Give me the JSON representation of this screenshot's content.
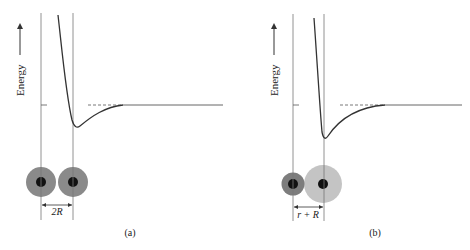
{
  "figure": {
    "y_axis_label": "Energy",
    "panels": [
      {
        "id": "a",
        "caption": "(a)",
        "distance_label": "2R",
        "atoms": [
          {
            "label": "atom-1",
            "radius_size": "R",
            "shade": "#8a8a8a"
          },
          {
            "label": "atom-2",
            "radius_size": "R",
            "shade": "#8a8a8a"
          }
        ]
      },
      {
        "id": "b",
        "caption": "(b)",
        "distance_label": "r + R",
        "atoms": [
          {
            "label": "small-atom",
            "radius_size": "r",
            "shade": "#7d7d7d"
          },
          {
            "label": "large-atom",
            "radius_size": "R",
            "shade": "#c4c4c4"
          }
        ]
      }
    ],
    "colors": {
      "line": "#555555",
      "curve": "#333333",
      "nucleus": "#111111"
    }
  }
}
